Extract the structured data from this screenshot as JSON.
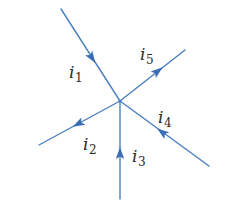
{
  "diagram": {
    "title": "",
    "colors": {
      "wire": "#4a7fc1",
      "arrow": "#3a6db5",
      "label": "#2a2a2a",
      "background": "#ffffff"
    },
    "junction": {
      "x": 120,
      "y": 101
    },
    "branches": [
      {
        "id": "i1",
        "label_main": "i",
        "label_sub": "1",
        "direction": "into-junction",
        "start": {
          "x": 61,
          "y": 9
        },
        "end": {
          "x": 120,
          "y": 101
        },
        "arrow_at": {
          "x": 92,
          "y": 58
        },
        "label_pos": {
          "x": 69,
          "y": 78
        }
      },
      {
        "id": "i2",
        "label_main": "i",
        "label_sub": "2",
        "direction": "out-of-junction",
        "start": {
          "x": 120,
          "y": 101
        },
        "end": {
          "x": 39,
          "y": 145
        },
        "arrow_at": {
          "x": 78,
          "y": 124
        },
        "label_pos": {
          "x": 83,
          "y": 150
        }
      },
      {
        "id": "i3",
        "label_main": "i",
        "label_sub": "3",
        "direction": "into-junction",
        "start": {
          "x": 120,
          "y": 199
        },
        "end": {
          "x": 120,
          "y": 101
        },
        "arrow_at": {
          "x": 120,
          "y": 153
        },
        "label_pos": {
          "x": 132,
          "y": 162
        }
      },
      {
        "id": "i4",
        "label_main": "i",
        "label_sub": "4",
        "direction": "into-junction",
        "start": {
          "x": 209,
          "y": 166
        },
        "end": {
          "x": 120,
          "y": 101
        },
        "arrow_at": {
          "x": 162,
          "y": 132
        },
        "label_pos": {
          "x": 158,
          "y": 123
        }
      },
      {
        "id": "i5",
        "label_main": "i",
        "label_sub": "5",
        "direction": "out-of-junction",
        "start": {
          "x": 120,
          "y": 101
        },
        "end": {
          "x": 185,
          "y": 50
        },
        "arrow_at": {
          "x": 158,
          "y": 71
        },
        "label_pos": {
          "x": 140,
          "y": 60
        }
      }
    ]
  }
}
